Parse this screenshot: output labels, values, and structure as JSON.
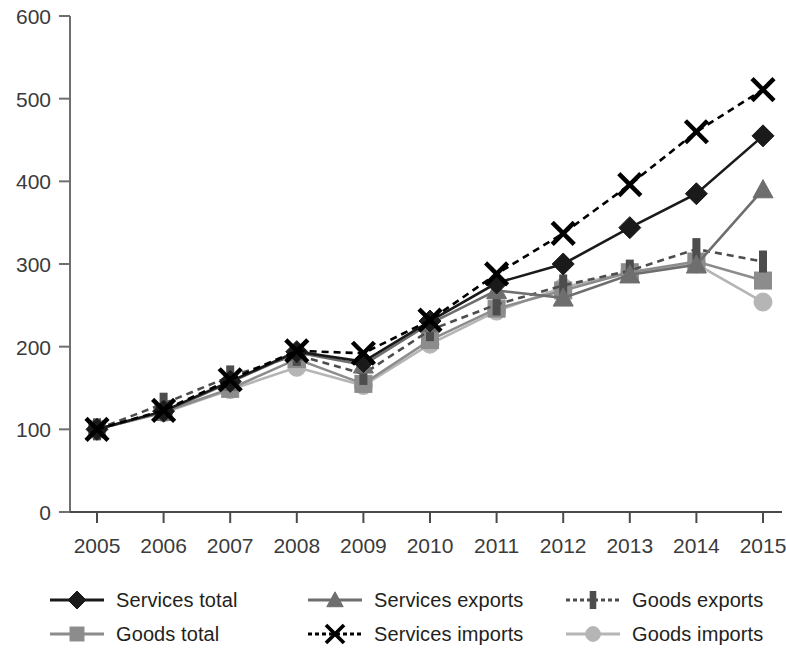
{
  "chart_data": {
    "type": "line",
    "title": "",
    "subtitle": "",
    "xlabel": "",
    "ylabel": "",
    "xlim": [
      2005,
      2015
    ],
    "ylim": [
      0,
      600
    ],
    "yticks": [
      0,
      100,
      200,
      300,
      400,
      500,
      600
    ],
    "grid": false,
    "legend_position": "bottom",
    "categories": [
      "2005",
      "2006",
      "2007",
      "2008",
      "2009",
      "2010",
      "2011",
      "2012",
      "2013",
      "2014",
      "2015"
    ],
    "series": [
      {
        "name": "Services total",
        "marker": "diamond",
        "line_style": "solid",
        "color": "#1a1a1a",
        "values": [
          100,
          122,
          158,
          194,
          182,
          231,
          277,
          300,
          344,
          385,
          455
        ]
      },
      {
        "name": "Goods total",
        "marker": "square",
        "line_style": "solid",
        "color": "#8c8c8c",
        "values": [
          100,
          121,
          149,
          185,
          155,
          208,
          246,
          268,
          290,
          303,
          280
        ]
      },
      {
        "name": "Services exports",
        "marker": "triangle",
        "line_style": "solid",
        "color": "#6e6e6e",
        "values": [
          100,
          121,
          157,
          193,
          178,
          228,
          268,
          259,
          287,
          299,
          390
        ]
      },
      {
        "name": "Services imports",
        "marker": "x",
        "line_style": "dashed",
        "color": "#000000",
        "values": [
          100,
          123,
          160,
          195,
          192,
          232,
          288,
          337,
          396,
          460,
          511
        ]
      },
      {
        "name": "Goods exports",
        "marker": "bar",
        "line_style": "dashed",
        "color": "#4d4d4d",
        "values": [
          100,
          131,
          164,
          190,
          167,
          220,
          251,
          274,
          292,
          318,
          303
        ]
      },
      {
        "name": "Goods imports",
        "marker": "circle",
        "line_style": "solid",
        "color": "#b5b5b5",
        "values": [
          100,
          120,
          148,
          175,
          153,
          203,
          243,
          272,
          290,
          300,
          254
        ]
      }
    ]
  },
  "legend": {
    "items": [
      {
        "label": "Services total"
      },
      {
        "label": "Services exports"
      },
      {
        "label": "Goods exports"
      },
      {
        "label": "Goods total"
      },
      {
        "label": "Services imports"
      },
      {
        "label": "Goods imports"
      }
    ]
  }
}
